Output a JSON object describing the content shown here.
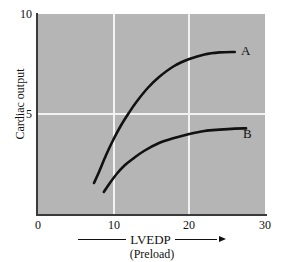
{
  "chart_data": {
    "type": "line",
    "title": "",
    "xlabel": "LVEDP",
    "xsublabel": "(Preload)",
    "ylabel": "Cardiac output",
    "xlim": [
      0,
      30
    ],
    "ylim": [
      0,
      10
    ],
    "xticks": [
      "0",
      "10",
      "20",
      "30"
    ],
    "xtick_values": [
      0,
      10,
      20,
      30
    ],
    "yticks": [
      "0",
      "5",
      "10"
    ],
    "ytick_values": [
      0,
      5,
      10
    ],
    "grid": true,
    "gridlines_x": [
      10,
      20
    ],
    "gridlines_y": [
      5
    ],
    "legend_position": "right-of-curve-end",
    "plot_background": "#b5b5b5",
    "grid_color": "#f2f2f2",
    "curve_color": "#111111",
    "axis_color": "#3a3a3a",
    "series": [
      {
        "name": "A",
        "label": "A",
        "x": [
          7.4,
          8.0,
          9.0,
          10.0,
          11.0,
          12.0,
          13.0,
          14.5,
          16.0,
          18.0,
          20.0,
          22.0,
          24.0,
          26.0
        ],
        "y": [
          1.55,
          2.05,
          2.95,
          3.75,
          4.45,
          5.05,
          5.6,
          6.3,
          6.85,
          7.4,
          7.75,
          7.98,
          8.08,
          8.1
        ]
      },
      {
        "name": "B",
        "label": "B",
        "x": [
          8.7,
          9.5,
          10.5,
          11.5,
          12.5,
          14.0,
          16.0,
          18.0,
          20.0,
          22.0,
          24.0,
          26.0,
          27.5
        ],
        "y": [
          1.1,
          1.55,
          2.05,
          2.45,
          2.75,
          3.15,
          3.55,
          3.8,
          4.0,
          4.15,
          4.22,
          4.27,
          4.28
        ]
      }
    ]
  },
  "labels": {
    "y_axis_title": "Cardiac output",
    "x_axis_title": "LVEDP",
    "x_axis_subtitle": "(Preload)",
    "ytick_10": "10",
    "ytick_5": "5",
    "ytick_0": "0",
    "xtick_0": "0",
    "xtick_10": "10",
    "xtick_20": "20",
    "xtick_30": "30",
    "series_a": "A",
    "series_b": "B"
  }
}
